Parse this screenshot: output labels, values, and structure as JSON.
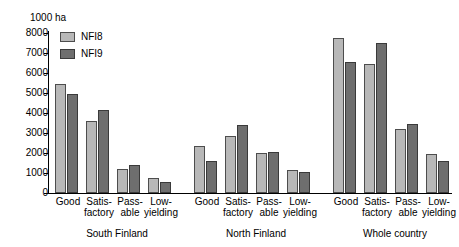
{
  "chart_data": {
    "type": "bar",
    "title": "",
    "subtitle": "",
    "unit_label": "1000 ha",
    "xlabel": "",
    "ylabel": "",
    "ylim": [
      0,
      8000
    ],
    "ytick_step": 1000,
    "yticks": [
      8000,
      7000,
      6000,
      5000,
      4000,
      3000,
      2000,
      1000,
      0
    ],
    "ytick_labels": [
      "8000",
      "7000",
      "6000",
      "5000",
      "4000",
      "3000",
      "2000",
      "1000",
      "0"
    ],
    "grid": false,
    "legend_position": "top-left-inside",
    "legend": [
      "NFI8",
      "NFI9"
    ],
    "colors": {
      "NFI8": "#b8b8b8",
      "NFI9": "#6e6e6e",
      "axis": "#000000"
    },
    "categories": [
      "Good",
      "Satis-factory",
      "Pass-able",
      "Low-yielding"
    ],
    "category_lines": [
      [
        "Good",
        ""
      ],
      [
        "Satis-",
        "factory"
      ],
      [
        "Pass-",
        "able"
      ],
      [
        "Low-",
        "yielding"
      ]
    ],
    "groups": [
      {
        "label": "South Finland",
        "series": [
          {
            "name": "NFI8",
            "values": [
              5450,
              3600,
              1220,
              760
            ]
          },
          {
            "name": "NFI9",
            "values": [
              4950,
              4150,
              1400,
              530
            ]
          }
        ]
      },
      {
        "label": "North Finland",
        "series": [
          {
            "name": "NFI8",
            "values": [
              2330,
              2870,
              1980,
              1170
            ]
          },
          {
            "name": "NFI9",
            "values": [
              1620,
              3400,
              2070,
              1060
            ]
          }
        ]
      },
      {
        "label": "Whole country",
        "series": [
          {
            "name": "NFI8",
            "values": [
              7750,
              6450,
              3200,
              1930
            ]
          },
          {
            "name": "NFI9",
            "values": [
              6550,
              7500,
              3450,
              1600
            ]
          }
        ]
      }
    ]
  }
}
